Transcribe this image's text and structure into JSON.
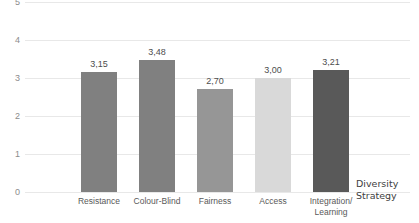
{
  "chart_data": {
    "type": "bar",
    "title": "",
    "subtitle": "",
    "xlabel": "Diversity Strategy",
    "ylabel": "",
    "categories": [
      "Resistance",
      "Colour-Blind",
      "Fairness",
      "Access",
      "Integration/ Learning"
    ],
    "category_lines": [
      [
        "Resistance"
      ],
      [
        "Colour-Blind"
      ],
      [
        "Fairness"
      ],
      [
        "Access"
      ],
      [
        "Integration/",
        "Learning"
      ]
    ],
    "values": [
      3.15,
      3.48,
      2.7,
      3.0,
      3.21
    ],
    "data_labels": [
      "3,15",
      "3,48",
      "2,70",
      "3,00",
      "3,21"
    ],
    "bar_colors": [
      "#808080",
      "#808080",
      "#969696",
      "#d9d9d9",
      "#595959"
    ],
    "ylim": [
      0,
      5
    ],
    "yticks": [
      0,
      1,
      2,
      3,
      4,
      5
    ],
    "ytick_labels": [
      "0",
      "1",
      "2",
      "3",
      "4",
      "5"
    ],
    "grid": true,
    "grid_color": "#e8e8e8",
    "legend": "none",
    "decimal_separator": ","
  },
  "axis_title": {
    "line1": "Diversity",
    "line2": "Strategy"
  }
}
